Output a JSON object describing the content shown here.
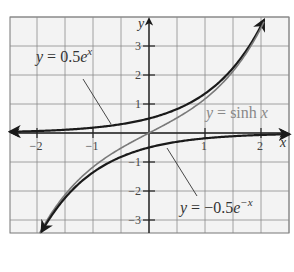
{
  "chart_data": {
    "type": "line",
    "title": "",
    "xlabel": "x",
    "ylabel": "y",
    "xlim": [
      -2.5,
      2.5
    ],
    "ylim": [
      -3.4,
      4.1
    ],
    "grid": true,
    "x_grid_step": 0.5,
    "y_grid_step": 1,
    "x_ticks": [
      -2,
      -1,
      1,
      2
    ],
    "x_tick_labels": [
      "−2",
      "−1",
      "1",
      "2"
    ],
    "y_ticks": [
      3,
      2,
      1,
      -1,
      -2,
      -3
    ],
    "y_tick_labels": [
      "3",
      "2",
      "1",
      "−1",
      "−2",
      "−3"
    ],
    "series": [
      {
        "name": "y = 0.5e^x",
        "function": "0.5*exp(x)",
        "x_range": [
          -2.5,
          2.05
        ],
        "color": "#1a1a1a",
        "arrows": [
          "left",
          "end"
        ],
        "values_at": {
          "x": [
            -2,
            -1,
            0,
            1,
            2
          ],
          "y": [
            0.068,
            0.184,
            0.5,
            1.359,
            3.695
          ]
        }
      },
      {
        "name": "y = sinh x",
        "function": "sinh(x)",
        "x_range": [
          -2.05,
          2.05
        ],
        "color": "#7a7a7a",
        "arrows": [],
        "values_at": {
          "x": [
            -2,
            -1,
            0,
            1,
            2
          ],
          "y": [
            -3.627,
            -1.175,
            0,
            1.175,
            3.627
          ]
        }
      },
      {
        "name": "y = -0.5e^-x",
        "function": "-0.5*exp(-x)",
        "x_range": [
          -2.05,
          2.5
        ],
        "color": "#1a1a1a",
        "arrows": [
          "start",
          "right"
        ],
        "values_at": {
          "x": [
            -2,
            -1,
            0,
            1,
            2
          ],
          "y": [
            -3.695,
            -1.359,
            -0.5,
            -0.184,
            -0.068
          ]
        }
      }
    ],
    "annotations": [
      {
        "text_parts": [
          "y",
          " = 0.5",
          "e",
          "x"
        ],
        "label": "y = 0.5e^x",
        "pos": [
          36,
          62
        ],
        "leader_from": [
          83,
          79
        ],
        "leader_to": [
          111,
          124
        ],
        "color": "#333333"
      },
      {
        "text_parts": [
          "y",
          " = sinh ",
          "x"
        ],
        "label": "y = sinh x",
        "pos": [
          206,
          118
        ],
        "color": "#888888"
      },
      {
        "text_parts": [
          "y",
          " = −0.5",
          "e",
          "−x"
        ],
        "label": "y = -0.5e^-x",
        "pos": [
          180,
          213
        ],
        "leader_from": [
          167,
          148
        ],
        "leader_to": [
          197,
          196
        ],
        "color": "#333333"
      }
    ]
  },
  "layout": {
    "plot_box": {
      "left": 10,
      "top": 17,
      "right": 289,
      "bottom": 233
    },
    "origin_px": [
      149,
      133
    ],
    "px_per_unit_x": 56,
    "px_per_unit_y": 29
  },
  "labels": {
    "x_axis": "x",
    "y_axis": "y"
  }
}
